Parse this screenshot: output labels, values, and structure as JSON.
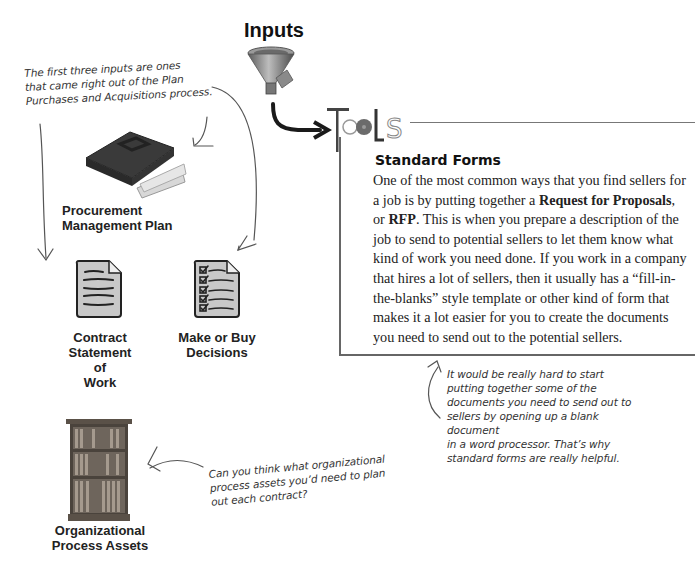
{
  "header": {
    "inputs_title": "Inputs",
    "tools_label": "Tools"
  },
  "inputs": [
    {
      "label": "Procurement Management Plan",
      "line1": "Procurement",
      "line2": "Management Plan",
      "icon": "briefcase-icon"
    },
    {
      "label": "Contract Statement of Work",
      "line1": "Contract",
      "line2": "Statement of",
      "line3": "Work",
      "icon": "document-icon"
    },
    {
      "label": "Make or Buy Decisions",
      "line1": "Make or Buy",
      "line2": "Decisions",
      "icon": "checklist-icon"
    },
    {
      "label": "Organizational Process Assets",
      "line1": "Organizational",
      "line2": "Process Assets",
      "icon": "bookcase-icon"
    }
  ],
  "tools_box": {
    "title": "Standard Forms",
    "body_parts": [
      "One of the most common ways that you find sellers for a job is by putting together a ",
      "Request for Proposals",
      ", or ",
      "RFP",
      ". This is when you prepare a description of the job to send to potential sellers to let them know what kind of work you need done. If you work in a company that hires a lot of sellers, then it usually has a “fill-in-the-blanks” style template or other kind of form that makes it a lot easier for you to create the documents you need to send out to the potential sellers."
    ]
  },
  "annotations": {
    "first_three": [
      "The first three inputs are ones",
      "that came right out of the Plan",
      "Purchases and Acquisitions process."
    ],
    "really_hard": [
      "It would be really hard to start",
      "putting together some of the",
      "documents you need to send out to",
      "sellers by opening up a blank document",
      "in a word processor. That’s why",
      "standard forms are really helpful."
    ],
    "can_you_think": [
      "Can you think what organizational",
      "process assets you’d need to plan",
      "out each contract?"
    ]
  },
  "colors": {
    "line": "#666666",
    "text": "#222222",
    "icon_fill": "#c8c8c8",
    "ink": "#333333"
  }
}
